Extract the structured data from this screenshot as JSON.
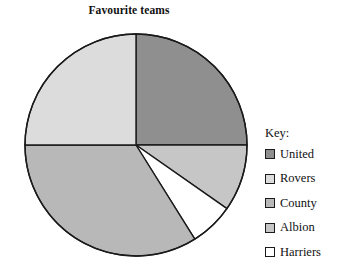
{
  "chart_data": {
    "type": "pie",
    "title": "Favourite teams",
    "xlabel": "",
    "ylabel": "",
    "legend_position": "right",
    "grid": false,
    "categories": [
      "United",
      "Rovers",
      "County",
      "Albion",
      "Harriers"
    ],
    "values": [
      25,
      25,
      34,
      10,
      6
    ],
    "units": "percent",
    "slices": [
      {
        "label": "United",
        "value": 25,
        "start_angle": 0,
        "end_angle": 90,
        "color": "#8f8f8f"
      },
      {
        "label": "Albion",
        "value": 10,
        "start_angle": 90,
        "end_angle": 125,
        "color": "#c6c6c6"
      },
      {
        "label": "Harriers",
        "value": 6,
        "start_angle": 125,
        "end_angle": 148,
        "color": "#ffffff"
      },
      {
        "label": "County",
        "value": 34,
        "start_angle": 148,
        "end_angle": 270,
        "color": "#b8b8b8"
      },
      {
        "label": "Rovers",
        "value": 25,
        "start_angle": 270,
        "end_angle": 360,
        "color": "#dcdcdc"
      }
    ],
    "geometry": {
      "center_x": 136,
      "center_y": 145,
      "radius": 111
    },
    "stroke_color": "#1a1a1a"
  },
  "legend": {
    "title": "Key:",
    "items": [
      {
        "label": "United",
        "color": "#8f8f8f"
      },
      {
        "label": "Rovers",
        "color": "#dcdcdc"
      },
      {
        "label": "County",
        "color": "#b8b8b8"
      },
      {
        "label": "Albion",
        "color": "#c6c6c6"
      },
      {
        "label": "Harriers",
        "color": "#ffffff"
      }
    ]
  }
}
